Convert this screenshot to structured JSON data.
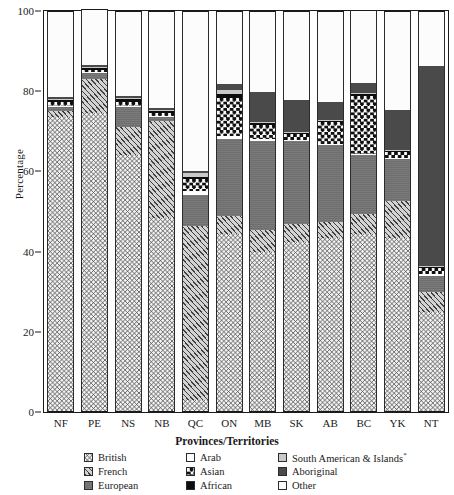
{
  "chart_data": {
    "type": "bar",
    "stacked": true,
    "title": "",
    "xlabel": "Provinces/Territories",
    "ylabel": "Percentage",
    "ylim": [
      0,
      100
    ],
    "yticks": [
      0,
      20,
      40,
      60,
      80,
      100
    ],
    "grid": false,
    "legend_position": "bottom",
    "categories": [
      "NF",
      "PE",
      "NS",
      "NB",
      "QC",
      "ON",
      "MB",
      "SK",
      "AB",
      "BC",
      "YK",
      "NT"
    ],
    "series": [
      {
        "name": "British",
        "key": "british",
        "values": [
          73.5,
          74.5,
          64.0,
          48.5,
          3.0,
          44.5,
          40.0,
          42.5,
          43.5,
          44.5,
          43.5,
          25.0
        ]
      },
      {
        "name": "French",
        "key": "french",
        "values": [
          1.5,
          8.5,
          7.0,
          24.0,
          43.5,
          4.5,
          5.5,
          4.5,
          4.0,
          5.0,
          9.0,
          5.0
        ]
      },
      {
        "name": "European",
        "key": "european",
        "values": [
          1.0,
          1.5,
          5.0,
          1.0,
          7.5,
          19.0,
          22.0,
          20.5,
          19.0,
          14.5,
          10.5,
          4.0
        ]
      },
      {
        "name": "Arab",
        "key": "arab",
        "values": [
          0.2,
          0.2,
          0.2,
          0.2,
          1.0,
          0.8,
          0.5,
          0.3,
          0.3,
          0.3,
          0.3,
          0.3
        ]
      },
      {
        "name": "Asian",
        "key": "asian",
        "values": [
          1.0,
          0.6,
          1.0,
          0.8,
          3.0,
          9.5,
          3.5,
          1.5,
          5.5,
          14.5,
          1.5,
          1.5
        ]
      },
      {
        "name": "African",
        "key": "african",
        "values": [
          0.5,
          0.5,
          0.8,
          0.5,
          0.5,
          1.0,
          0.5,
          0.3,
          0.3,
          0.5,
          0.3,
          0.3
        ]
      },
      {
        "name": "South American & Islands",
        "key": "south",
        "values": [
          0.3,
          0.2,
          0.3,
          0.2,
          1.0,
          1.0,
          0.3,
          0.3,
          0.3,
          0.3,
          0.3,
          0.3
        ]
      },
      {
        "name": "Aboriginal",
        "key": "aboriginal",
        "values": [
          0.5,
          0.5,
          0.5,
          0.5,
          0.5,
          1.5,
          7.5,
          8.0,
          4.5,
          2.5,
          10.0,
          50.0
        ]
      },
      {
        "name": "Other",
        "key": "other",
        "values": [
          21.5,
          14.0,
          21.2,
          24.3,
          40.0,
          18.2,
          20.2,
          22.1,
          22.6,
          18.2,
          24.6,
          13.6
        ]
      }
    ]
  },
  "axes": {
    "ylabel": "Percentage",
    "xtitle": "Provinces/Territories",
    "yticks": [
      "0",
      "20",
      "40",
      "60",
      "80",
      "100"
    ],
    "xticks": [
      "NF",
      "PE",
      "NS",
      "NB",
      "QC",
      "ON",
      "MB",
      "SK",
      "AB",
      "BC",
      "YK",
      "NT"
    ]
  },
  "legend": {
    "rows": [
      [
        {
          "label": "British",
          "swatch": "p-british"
        },
        {
          "label": "Arab",
          "swatch": "p-arab"
        },
        {
          "label": "South American & Islands",
          "sup": "*",
          "swatch": "p-south"
        }
      ],
      [
        {
          "label": "French",
          "swatch": "p-french"
        },
        {
          "label": "Asian",
          "swatch": "p-asian"
        },
        {
          "label": "Aboriginal",
          "swatch": "p-aboriginal"
        }
      ],
      [
        {
          "label": "European",
          "swatch": "p-european"
        },
        {
          "label": "African",
          "swatch": "p-african"
        },
        {
          "label": "Other",
          "swatch": "p-other"
        }
      ]
    ]
  },
  "colors": {
    "axis": "#1a1a1a",
    "european": "#6e6e6e",
    "aboriginal": "#4a4a4a",
    "african": "#0d0d0d",
    "south": "#c9c9c9"
  }
}
